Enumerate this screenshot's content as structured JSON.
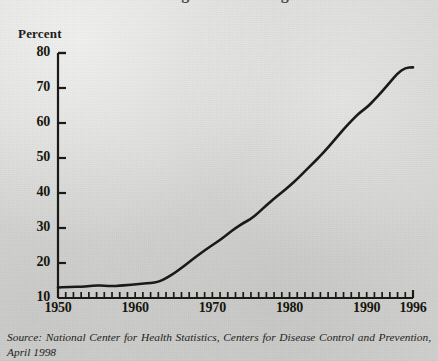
{
  "figure": {
    "title_remnant": "Percentage of Overweight Americans",
    "y_axis_label": "Percent",
    "source_note": "Source: National Center for Health Statistics, Centers for Disease Control and Prevention, April 1998",
    "source_prefix": "Source:",
    "source_body": "National Center for Health Statistics, Centers for Disease Control and Prevention, April 1998"
  },
  "chart_data": {
    "type": "line",
    "title": "Percent",
    "xlabel": "",
    "ylabel": "Percent",
    "xlim": [
      1950,
      1996
    ],
    "ylim": [
      10,
      80
    ],
    "ytick_labels": [
      "80",
      "70",
      "60",
      "50",
      "40",
      "30",
      "20",
      "10"
    ],
    "yticks": [
      80,
      70,
      60,
      50,
      40,
      30,
      20,
      10
    ],
    "xtick_labels": [
      "1950",
      "1960",
      "1970",
      "1980",
      "1990",
      "1996"
    ],
    "xticks": [
      1950,
      1960,
      1970,
      1980,
      1990,
      1996
    ],
    "minor_xtick_interval": 1,
    "grid": false,
    "legend": "none",
    "line_color": "#1a1a16",
    "line_width": 2.6,
    "x": [
      1950,
      1951,
      1952,
      1953,
      1954,
      1955,
      1956,
      1957,
      1958,
      1959,
      1960,
      1961,
      1962,
      1963,
      1964,
      1965,
      1966,
      1967,
      1968,
      1969,
      1970,
      1971,
      1972,
      1973,
      1974,
      1975,
      1976,
      1977,
      1978,
      1979,
      1980,
      1981,
      1982,
      1983,
      1984,
      1985,
      1986,
      1987,
      1988,
      1989,
      1990,
      1991,
      1992,
      1993,
      1994,
      1995,
      1996
    ],
    "values": [
      13.0,
      13.1,
      13.2,
      13.2,
      13.4,
      13.6,
      13.5,
      13.4,
      13.5,
      13.7,
      13.9,
      14.1,
      14.3,
      14.6,
      15.6,
      17.0,
      18.6,
      20.3,
      22.0,
      23.6,
      25.1,
      26.6,
      28.3,
      30.0,
      31.4,
      32.6,
      34.4,
      36.5,
      38.4,
      40.2,
      42.0,
      44.0,
      46.2,
      48.4,
      50.6,
      53.0,
      55.6,
      58.2,
      60.6,
      62.8,
      64.4,
      66.6,
      69.0,
      71.6,
      74.2,
      75.8,
      75.9
    ]
  }
}
